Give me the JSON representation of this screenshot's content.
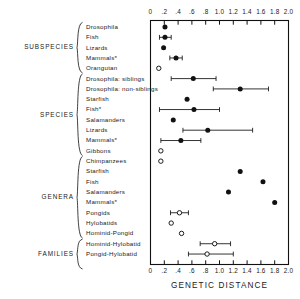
{
  "figure": {
    "axis_title": "GENETIC DISTANCE",
    "x_min": 0,
    "x_max": 2.0,
    "tick_labels": [
      "0",
      ".2",
      ".4",
      ".6",
      ".8",
      "1.0",
      "1.2",
      "1.4",
      "1.6",
      "1.8",
      "2.0"
    ],
    "tick_values": [
      0,
      0.2,
      0.4,
      0.6,
      0.8,
      1.0,
      1.2,
      1.4,
      1.6,
      1.8,
      2.0
    ]
  },
  "groups": [
    {
      "label": "SUBSPECIES",
      "row_start": 0,
      "row_end": 4
    },
    {
      "label": "SPECIES",
      "row_start": 5,
      "row_end": 12
    },
    {
      "label": "GENERA",
      "row_start": 13,
      "row_end": 20
    },
    {
      "label": "FAMILIES",
      "row_start": 21,
      "row_end": 23
    }
  ],
  "chart_data": {
    "type": "scatter",
    "title": "",
    "xlabel": "GENETIC DISTANCE",
    "ylabel": "",
    "xlim": [
      0,
      2.0
    ],
    "grid": false,
    "legend": null,
    "marker_styles": {
      "filled": "filled circle",
      "open": "open circle"
    },
    "categories": [
      "Drosophila",
      "Fish",
      "Lizards",
      "Mammals*",
      "Orangutan",
      "Drosophila: siblings",
      "Drosophila: non-siblings",
      "Starfish",
      "Fish*",
      "Salamanders",
      "Lizards",
      "Mammals*",
      "Gibbons",
      "Chimpanzees",
      "Starfish",
      "Fish",
      "Salamanders",
      "Mammals*",
      "Pongids",
      "Hylobatids",
      "Hominid-Pongid",
      "Hominid-Hylobatid",
      "Pongid-Hylobatid"
    ],
    "points": [
      {
        "label": "Drosophila",
        "value": 0.21,
        "low": null,
        "high": null,
        "marker": "filled"
      },
      {
        "label": "Fish",
        "value": 0.21,
        "low": 0.13,
        "high": 0.3,
        "marker": "filled"
      },
      {
        "label": "Lizards",
        "value": 0.19,
        "low": null,
        "high": null,
        "marker": "filled"
      },
      {
        "label": "Mammals*",
        "value": 0.37,
        "low": 0.28,
        "high": 0.46,
        "marker": "filled"
      },
      {
        "label": "Orangutan",
        "value": 0.12,
        "low": null,
        "high": null,
        "marker": "open"
      },
      {
        "label": "Drosophila: siblings",
        "value": 0.62,
        "low": 0.3,
        "high": 0.95,
        "marker": "filled"
      },
      {
        "label": "Drosophila: non-siblings",
        "value": 1.3,
        "low": 0.91,
        "high": 1.71,
        "marker": "filled"
      },
      {
        "label": "Starfish",
        "value": 0.53,
        "low": null,
        "high": null,
        "marker": "filled"
      },
      {
        "label": "Fish*",
        "value": 0.63,
        "low": 0.13,
        "high": 1.0,
        "marker": "filled"
      },
      {
        "label": "Salamanders",
        "value": 0.33,
        "low": null,
        "high": null,
        "marker": "filled"
      },
      {
        "label": "Lizards",
        "value": 0.83,
        "low": 0.47,
        "high": 1.48,
        "marker": "filled"
      },
      {
        "label": "Mammals*",
        "value": 0.44,
        "low": 0.15,
        "high": 0.73,
        "marker": "filled"
      },
      {
        "label": "Gibbons",
        "value": 0.15,
        "low": null,
        "high": null,
        "marker": "open"
      },
      {
        "label": "Chimpanzees",
        "value": 0.15,
        "low": null,
        "high": null,
        "marker": "open"
      },
      {
        "label": "Starfish",
        "value": 1.3,
        "low": null,
        "high": null,
        "marker": "filled"
      },
      {
        "label": "Fish",
        "value": 1.63,
        "low": null,
        "high": null,
        "marker": "filled"
      },
      {
        "label": "Salamanders",
        "value": 1.13,
        "low": null,
        "high": null,
        "marker": "filled"
      },
      {
        "label": "Mammals*",
        "value": 1.8,
        "low": null,
        "high": null,
        "marker": "filled"
      },
      {
        "label": "Pongids",
        "value": 0.42,
        "low": 0.29,
        "high": 0.55,
        "marker": "open"
      },
      {
        "label": "Hylobatids",
        "value": 0.3,
        "low": null,
        "high": null,
        "marker": "open"
      },
      {
        "label": "Hominid-Pongid",
        "value": 0.45,
        "low": null,
        "high": null,
        "marker": "open"
      },
      {
        "label": "Hominid-Hylobatid",
        "value": 0.93,
        "low": 0.72,
        "high": 1.16,
        "marker": "open"
      },
      {
        "label": "Pongid-Hylobatid",
        "value": 0.82,
        "low": 0.55,
        "high": 1.2,
        "marker": "open"
      }
    ]
  }
}
